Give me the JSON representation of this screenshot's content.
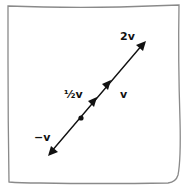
{
  "diagram": {
    "type": "vector scalar multiples (hand-drawn)",
    "colors": {
      "background": "#ffffff",
      "frame": "#8a8a8a",
      "ink": "#111111"
    },
    "labels": {
      "two_v": "2v",
      "half_v": "½v",
      "v": "v",
      "neg_v": "−v"
    },
    "elements": [
      {
        "name": "origin",
        "kind": "dot",
        "x": 81,
        "y": 118
      },
      {
        "name": "half_v",
        "kind": "arrowhead",
        "tip": [
          97,
          97
        ]
      },
      {
        "name": "v",
        "kind": "arrowhead",
        "tip": [
          111,
          80
        ]
      },
      {
        "name": "two_v",
        "kind": "arrowhead",
        "tip": [
          146,
          41
        ]
      },
      {
        "name": "neg_v",
        "kind": "arrowhead",
        "tip": [
          48,
          156
        ]
      }
    ]
  }
}
